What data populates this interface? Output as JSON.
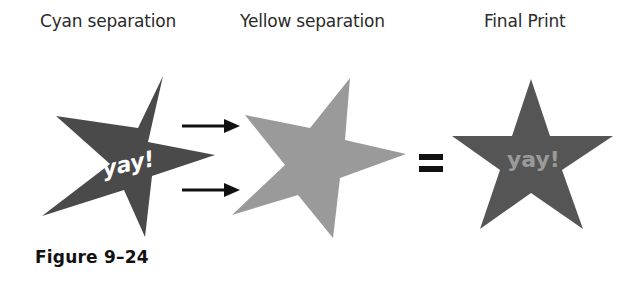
{
  "headings": {
    "cyan": "Cyan separation",
    "yellow": "Yellow separation",
    "final": "Final Print"
  },
  "stars": {
    "cyan": {
      "text": "yay!",
      "fill": "#4a4a4a",
      "text_color": "#ffffff"
    },
    "yellow": {
      "fill": "#9a9a9a"
    },
    "final": {
      "text": "yay!",
      "fill": "#555555",
      "text_color": "#9a9a9a"
    }
  },
  "symbols": {
    "arrow_top": "arrow-right",
    "arrow_bottom": "arrow-right",
    "equals": "="
  },
  "caption": "Figure 9–24"
}
